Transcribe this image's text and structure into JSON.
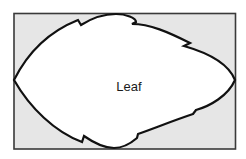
{
  "diagram": {
    "label": "Leaf",
    "colors": {
      "background_rect_fill": "#e6e6e6",
      "rect_stroke": "#3a3a3a",
      "leaf_fill": "#ffffff",
      "leaf_stroke": "#111111",
      "label_color": "#1a1a1a"
    }
  }
}
